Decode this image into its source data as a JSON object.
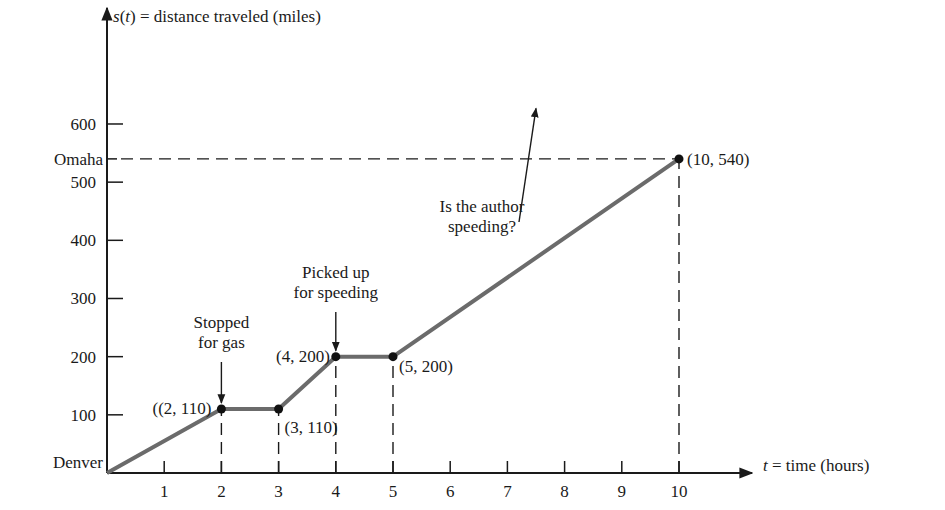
{
  "chart_data": {
    "type": "line",
    "title": "",
    "xlabel": "t = time (hours)",
    "ylabel": "s(t) = distance traveled (miles)",
    "xlim": [
      0,
      10.6
    ],
    "ylim": [
      0,
      660
    ],
    "grid": false,
    "legend": null,
    "x_ticks": [
      1,
      2,
      3,
      4,
      5,
      6,
      7,
      8,
      9,
      10
    ],
    "x_tick_labels": [
      "1",
      "2",
      "3",
      "4",
      "5",
      "6",
      "7",
      "8",
      "9",
      "10"
    ],
    "y_ticks": [
      100,
      200,
      300,
      400,
      500,
      600
    ],
    "y_tick_labels": [
      "100",
      "200",
      "300",
      "400",
      "500",
      "600"
    ],
    "y_named_ticks": [
      {
        "value": 0,
        "label": "Denver"
      },
      {
        "value": 540,
        "label": "Omaha"
      }
    ],
    "series": [
      {
        "name": "s(t)",
        "color": "#6b6b6b",
        "points": [
          [
            0,
            0
          ],
          [
            2,
            110
          ],
          [
            3,
            110
          ],
          [
            4,
            200
          ],
          [
            5,
            200
          ],
          [
            10,
            540
          ]
        ]
      }
    ],
    "marked_points": [
      {
        "x": 2,
        "y": 110,
        "label": "((2, 110)"
      },
      {
        "x": 3,
        "y": 110,
        "label": "(3, 110)"
      },
      {
        "x": 4,
        "y": 200,
        "label": "(4, 200)"
      },
      {
        "x": 5,
        "y": 200,
        "label": "(5, 200)"
      },
      {
        "x": 10,
        "y": 540,
        "label": "(10, 540)"
      }
    ],
    "annotations": [
      {
        "lines": [
          "Stopped",
          "for gas"
        ],
        "points_to": [
          2,
          110
        ]
      },
      {
        "lines": [
          "Picked up",
          "for speeding"
        ],
        "points_to": [
          4,
          200
        ]
      },
      {
        "lines": [
          "Is the author",
          "speeding?"
        ],
        "points_to": [
          7.5,
          381
        ]
      }
    ],
    "dashed_guides": [
      {
        "from": [
          0,
          540
        ],
        "to": [
          10,
          540
        ]
      },
      {
        "from": [
          10,
          0
        ],
        "to": [
          10,
          540
        ]
      },
      {
        "from": [
          2,
          0
        ],
        "to": [
          2,
          110
        ]
      },
      {
        "from": [
          3,
          0
        ],
        "to": [
          3,
          110
        ]
      },
      {
        "from": [
          4,
          0
        ],
        "to": [
          4,
          200
        ]
      },
      {
        "from": [
          5,
          0
        ],
        "to": [
          5,
          200
        ]
      }
    ]
  },
  "labels": {
    "ylabel_s": "s",
    "ylabel_t": "t",
    "ylabel_rest": " = distance traveled (miles)",
    "xlabel_t": "t",
    "xlabel_rest": " = time (hours)"
  }
}
